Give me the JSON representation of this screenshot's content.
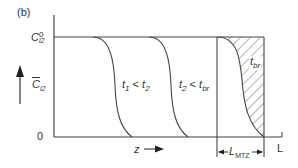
{
  "figure": {
    "panel_label": "(b)",
    "y_axis": {
      "top_label_main": "C",
      "top_label_sup": "0",
      "top_label_sub": "i2",
      "mid_label_main": "C",
      "mid_label_sub": "i2",
      "bottom_label": "0"
    },
    "x_axis": {
      "label": "z",
      "end_label": "L",
      "mtz_label_main": "L",
      "mtz_label_sub": "MTZ"
    },
    "curves": [
      {
        "label_a": "t",
        "label_a_sub": "1",
        "rel": " < ",
        "label_b": "t",
        "label_b_sub": "2"
      },
      {
        "label_a": "t",
        "label_a_sub": "2",
        "rel": " < ",
        "label_b": "t",
        "label_b_sub": "br"
      },
      {
        "label_a": "t",
        "label_a_sub": "br"
      }
    ],
    "colors": {
      "line": "#444444",
      "hatch": "#555555"
    }
  }
}
